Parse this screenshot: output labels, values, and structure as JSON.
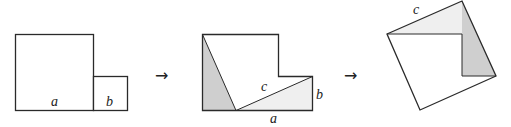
{
  "figure": {
    "colors": {
      "stroke": "#2a2a2a",
      "dark_fill": "#cfcfcf",
      "light_fill": "#efefef",
      "background": "#ffffff"
    },
    "panels": [
      {
        "id": "panel-1",
        "description": "Two squares side by side with sides a and b",
        "labels": {
          "a": "a",
          "b": "b"
        }
      },
      {
        "id": "panel-2",
        "description": "Combined shape cut into two right triangles with hypotenuse c",
        "labels": {
          "a": "a",
          "b": "b",
          "c": "c"
        }
      },
      {
        "id": "panel-3",
        "description": "Triangles rearranged into a square of side c",
        "labels": {
          "c": "c"
        }
      }
    ],
    "arrows": [
      "→",
      "→"
    ]
  }
}
